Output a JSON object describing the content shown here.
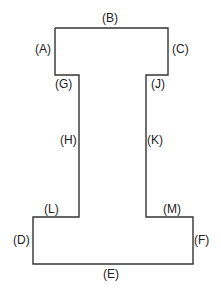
{
  "diagram": {
    "shape": "I-beam outline",
    "stroke_color": "#333333",
    "labels": {
      "A": "(A)",
      "B": "(B)",
      "C": "(C)",
      "D": "(D)",
      "E": "(E)",
      "F": "(F)",
      "G": "(G)",
      "H": "(H)",
      "J": "(J)",
      "K": "(K)",
      "L": "(L)",
      "M": "(M)"
    }
  }
}
